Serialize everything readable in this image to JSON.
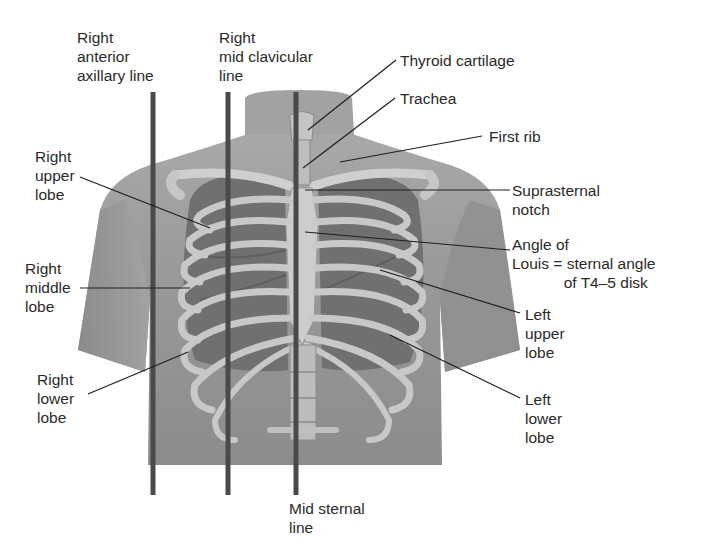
{
  "diagram": {
    "colors": {
      "background": "#ffffff",
      "skin": "#9a9a9a",
      "skin_dark": "#7e7e7e",
      "lung": "#6f6f6f",
      "bone": "#c9c9c9",
      "reference_line": "#4a4a4a",
      "leader": "#1e1e1e",
      "text": "#2a2a2a"
    },
    "reference_lines": [
      {
        "id": "right-anterior-axillary",
        "label": "Right\nanterior\naxillary line"
      },
      {
        "id": "right-mid-clavicular",
        "label": "Right\nmid clavicular\nline"
      },
      {
        "id": "mid-sternal",
        "label": "Mid sternal\nline"
      }
    ],
    "labels": {
      "right_anterior_axillary": "Right\nanterior\naxillary line",
      "right_mid_clavicular": "Right\nmid clavicular\nline",
      "thyroid_cartilage": "Thyroid cartilage",
      "trachea": "Trachea",
      "first_rib": "First rib",
      "suprasternal_notch": "Suprasternal\nnotch",
      "angle_of_louis": "Angle of\nLouis = sternal angle\n            of T4–5 disk",
      "right_upper_lobe": "Right\nupper\nlobe",
      "right_middle_lobe": "Right\nmiddle\nlobe",
      "right_lower_lobe": "Right\nlower\nlobe",
      "left_upper_lobe": "Left\nupper\nlobe",
      "left_lower_lobe": "Left\nlower\nlobe",
      "mid_sternal": "Mid sternal\nline"
    }
  }
}
